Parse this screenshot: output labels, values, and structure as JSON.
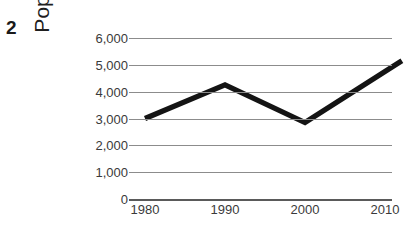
{
  "question_number": "2",
  "chart_data": {
    "type": "line",
    "title": "",
    "xlabel": "",
    "ylabel": "Population",
    "x": [
      1980,
      1990,
      2000,
      2010
    ],
    "categories": [
      "1980",
      "1990",
      "2000",
      "2010"
    ],
    "values": [
      3000,
      4250,
      2850,
      4750
    ],
    "series": [
      {
        "name": "Population",
        "values": [
          3000,
          4250,
          2850,
          4750
        ]
      }
    ],
    "ylim": [
      0,
      6000
    ],
    "y_ticks": [
      0,
      1000,
      2000,
      3000,
      4000,
      5000,
      6000
    ],
    "y_tick_labels": [
      "0",
      "1,000",
      "2,000",
      "3,000",
      "4,000",
      "5,000",
      "6,000"
    ],
    "x_tick_labels": [
      "1980",
      "1990",
      "2000",
      "2010"
    ],
    "grid": "horizontal",
    "legend": "none",
    "line_color": "#141414",
    "gridline_color": "#8c8c8c",
    "line_extends_past_last_tick": true,
    "last_segment_end_value": 4750
  }
}
